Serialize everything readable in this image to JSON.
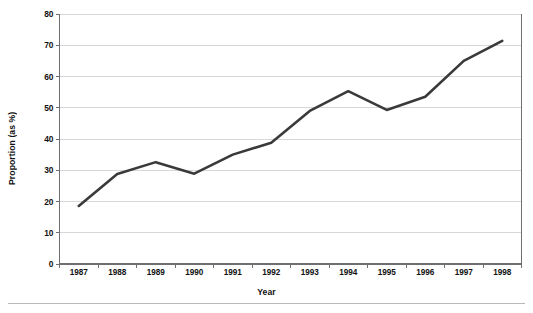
{
  "chart_data": {
    "type": "line",
    "title": "",
    "subtitle": "",
    "xlabel": "Year",
    "ylabel": "Proportion (as %)",
    "categories": [
      "1987",
      "1988",
      "1989",
      "1990",
      "1991",
      "1992",
      "1993",
      "1994",
      "1995",
      "1996",
      "1997",
      "1998"
    ],
    "x": [
      1987,
      1988,
      1989,
      1990,
      1991,
      1992,
      1993,
      1994,
      1995,
      1996,
      1997,
      1998
    ],
    "values": [
      18.6,
      28.8,
      32.6,
      28.9,
      35.0,
      38.8,
      49.0,
      55.3,
      49.3,
      53.5,
      65.0,
      71.4
    ],
    "series": [
      {
        "name": "Proportion",
        "values": [
          18.6,
          28.8,
          32.6,
          28.9,
          35.0,
          38.8,
          49.0,
          55.3,
          49.3,
          53.5,
          65.0,
          71.4
        ],
        "color": "#3a3a3a"
      }
    ],
    "ylim": [
      0,
      80
    ],
    "ytick_values": [
      0,
      10,
      20,
      30,
      40,
      50,
      60,
      70,
      80
    ],
    "ytick_labels": [
      "0",
      "10",
      "20",
      "30",
      "40",
      "50",
      "60",
      "70",
      "80"
    ],
    "xtick_labels": [
      "1987",
      "1988",
      "1989",
      "1990",
      "1991",
      "1992",
      "1993",
      "1994",
      "1995",
      "1996",
      "1997",
      "1998"
    ],
    "grid": true,
    "grid_axis": "y",
    "legend": false,
    "legend_position": "none",
    "markers": false,
    "annotations": []
  },
  "style": {
    "line_color": "#3a3a3a",
    "line_width": 2.6,
    "grid_color": "#d8d8dc",
    "axis_color": "#6e6e73",
    "text_color": "#111111",
    "background": "#ffffff",
    "footer_rule_color": "#b9b9bd"
  },
  "axes": {
    "x_title": "Year",
    "y_title": "Proportion (as %)"
  },
  "footer": {
    "rule": ""
  }
}
